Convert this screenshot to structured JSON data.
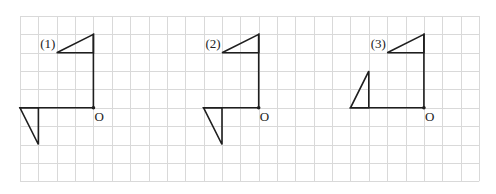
{
  "diagram": {
    "type": "grid-transformation-figures",
    "grid": {
      "origin_px": [
        20,
        16
      ],
      "cell_px": 18.36,
      "cols": 25,
      "rows": 9,
      "line_color": "#d9d9d9"
    },
    "stroke_color": "#1e1e1e",
    "figures": [
      {
        "label": "(1)",
        "origin_label": "O",
        "origin_cell": [
          4,
          5
        ],
        "label_cell": [
          1.1,
          1.75
        ],
        "top_triangle_cells": [
          [
            4,
            1
          ],
          [
            2,
            2
          ],
          [
            4,
            2
          ]
        ],
        "stem_cells": [
          [
            4,
            1
          ],
          [
            4,
            5
          ]
        ],
        "arm_cells": [
          [
            4,
            5
          ],
          [
            0,
            5
          ]
        ],
        "bottom_triangle_cells": [
          [
            0,
            5
          ],
          [
            1,
            5
          ],
          [
            1,
            7
          ]
        ]
      },
      {
        "label": "(2)",
        "origin_label": "O",
        "origin_cell": [
          13,
          5
        ],
        "label_cell": [
          10.1,
          1.75
        ],
        "top_triangle_cells": [
          [
            13,
            1
          ],
          [
            11,
            2
          ],
          [
            13,
            2
          ]
        ],
        "stem_cells": [
          [
            13,
            1
          ],
          [
            13,
            5
          ]
        ],
        "arm_cells": [
          [
            13,
            5
          ],
          [
            10,
            5
          ]
        ],
        "bottom_triangle_cells": [
          [
            10,
            5
          ],
          [
            11,
            5
          ],
          [
            11,
            7
          ]
        ]
      },
      {
        "label": "(3)",
        "origin_label": "O",
        "origin_cell": [
          22,
          5
        ],
        "label_cell": [
          19.1,
          1.75
        ],
        "top_triangle_cells": [
          [
            22,
            1
          ],
          [
            20,
            2
          ],
          [
            22,
            2
          ]
        ],
        "stem_cells": [
          [
            22,
            1
          ],
          [
            22,
            5
          ]
        ],
        "arm_cells": [
          [
            22,
            5
          ],
          [
            18,
            5
          ]
        ],
        "bottom_triangle_cells": [
          [
            18,
            5
          ],
          [
            19,
            5
          ],
          [
            19,
            3
          ]
        ]
      }
    ]
  }
}
